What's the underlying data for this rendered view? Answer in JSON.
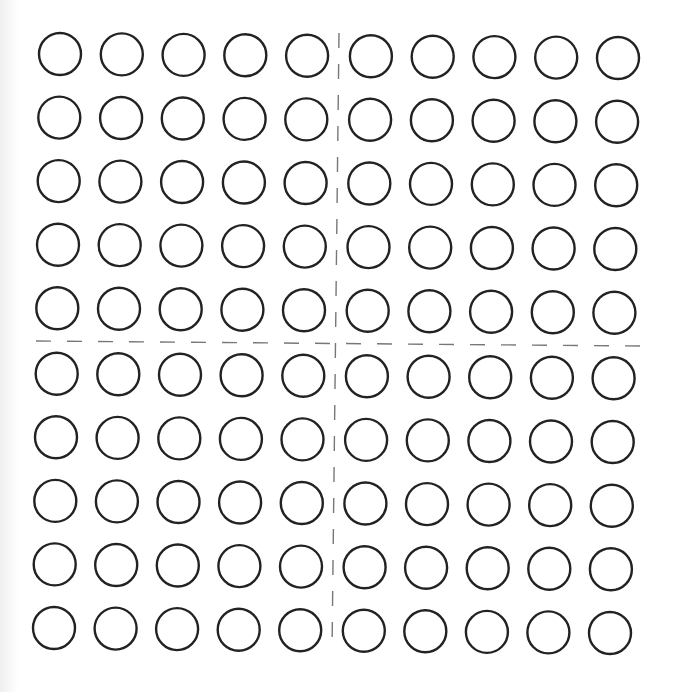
{
  "worksheet": {
    "grid": {
      "rows": 10,
      "columns": 10,
      "total_circles": 100,
      "circle_style": "outline",
      "circle_radius": 21,
      "stroke_color": "#222222",
      "stroke_width": 2.4,
      "corner_centers": {
        "top_left": [
          61,
          55
        ],
        "top_right": [
          617,
          59
        ],
        "bottom_left": [
          55,
          627
        ],
        "bottom_right": [
          609,
          632
        ]
      },
      "divider_gap_extra": 2
    },
    "dividers": {
      "vertical": {
        "from": [
          339,
          33
        ],
        "to": [
          332,
          652
        ],
        "dash": 15,
        "gap": 16,
        "color": "#777777"
      },
      "horizontal": {
        "from": [
          36,
          341
        ],
        "to": [
          640,
          346
        ],
        "dash": 15,
        "gap": 16,
        "color": "#777777"
      }
    },
    "quadrants": [
      {
        "name": "top-left",
        "rows": 5,
        "columns": 5
      },
      {
        "name": "top-right",
        "rows": 5,
        "columns": 5
      },
      {
        "name": "bottom-left",
        "rows": 5,
        "columns": 5
      },
      {
        "name": "bottom-right",
        "rows": 5,
        "columns": 5
      }
    ],
    "background_color": "#ffffff"
  }
}
